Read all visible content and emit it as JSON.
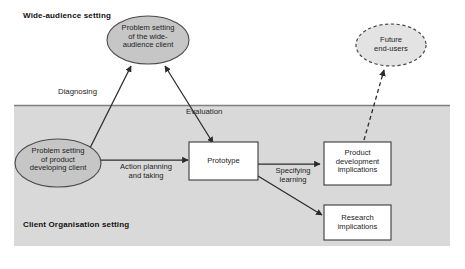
{
  "diagram": {
    "title_zones": [
      {
        "name": "wide-audience-zone",
        "label": "Wide-audience setting"
      },
      {
        "name": "client-organisation-zone",
        "label": "Client Organisation setting"
      }
    ],
    "colors": {
      "zone_fill": "#d9d9d9",
      "zone_divider": "#808080",
      "ellipse_fill": "#c6c6c6",
      "ellipse_stroke": "#4a4a4a",
      "box_fill": "#ffffff",
      "box_stroke": "#3a3a3a",
      "arrow": "#2b2b2b",
      "text": "#1d1d1d"
    },
    "nodes": [
      {
        "id": "wide-audience-problem",
        "shape": "ellipse",
        "style": "solid",
        "label": "Problem setting\nof the wide-\naudience client"
      },
      {
        "id": "future-end-users",
        "shape": "ellipse",
        "style": "dashed",
        "label": "Future\nend-users"
      },
      {
        "id": "product-developing-problem",
        "shape": "ellipse",
        "style": "solid",
        "label": "Problem setting\nof product\ndeveloping client"
      },
      {
        "id": "prototype",
        "shape": "rect",
        "style": "solid",
        "label": "Prototype"
      },
      {
        "id": "product-development-implications",
        "shape": "rect",
        "style": "solid",
        "label": "Product\ndevelopment\nimplications"
      },
      {
        "id": "research-implications",
        "shape": "rect",
        "style": "solid",
        "label": "Research\nimplications"
      }
    ],
    "edges": [
      {
        "id": "diagnosing",
        "label": "Diagnosing",
        "from": "product-developing-problem",
        "to": "wide-audience-problem",
        "arrowheads": "both",
        "style": "solid"
      },
      {
        "id": "evaluation",
        "label": "Evaluation",
        "from": "prototype",
        "to": "wide-audience-problem",
        "arrowheads": "both",
        "style": "solid"
      },
      {
        "id": "action-planning-and-taking",
        "label": "Action planning\nand taking",
        "from": "product-developing-problem",
        "to": "prototype",
        "arrowheads": "end",
        "style": "solid"
      },
      {
        "id": "specifying-learning",
        "label": "Specifying\nlearning",
        "from": "prototype",
        "to": "product-development-implications",
        "arrowheads": "end",
        "style": "solid"
      },
      {
        "id": "prototype-to-research",
        "label": "",
        "from": "prototype",
        "to": "research-implications",
        "arrowheads": "end",
        "style": "solid"
      },
      {
        "id": "implications-to-future-users",
        "label": "",
        "from": "product-development-implications",
        "to": "future-end-users",
        "arrowheads": "end",
        "style": "dashed"
      }
    ]
  }
}
